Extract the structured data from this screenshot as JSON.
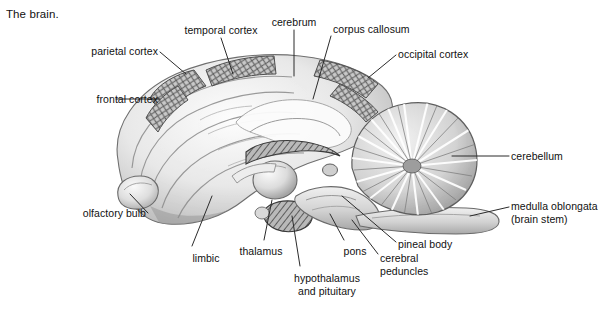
{
  "figure": {
    "title": "The brain.",
    "style": "pencil-shaded anatomical illustration, greyscale",
    "background_color": "#ffffff",
    "ink_color": "#111111",
    "leader_line_color": "#2b2b2b"
  },
  "labels": [
    {
      "id": "frontal-cortex",
      "text": "frontal cortex",
      "align": "right",
      "x": 62,
      "y": 93,
      "w": 96
    },
    {
      "id": "parietal-cortex",
      "text": "parietal cortex",
      "align": "right",
      "x": 30,
      "y": 45,
      "w": 128
    },
    {
      "id": "temporal-cortex",
      "text": "temporal cortex",
      "align": "center",
      "x": 168,
      "y": 24,
      "w": 106
    },
    {
      "id": "cerebrum",
      "text": "cerebrum",
      "align": "center",
      "x": 262,
      "y": 16,
      "w": 64
    },
    {
      "id": "corpus-callosum",
      "text": "corpus callosum",
      "align": "left",
      "x": 333,
      "y": 23,
      "w": 104
    },
    {
      "id": "occipital-cortex",
      "text": "occipital cortex",
      "align": "left",
      "x": 398,
      "y": 48,
      "w": 102
    },
    {
      "id": "cerebellum",
      "text": "cerebellum",
      "align": "left",
      "x": 511,
      "y": 150,
      "w": 78
    },
    {
      "id": "medulla-oblongata",
      "text": "medulla oblongata\n(brain stem)",
      "align": "left",
      "x": 511,
      "y": 200,
      "w": 92
    },
    {
      "id": "olfactory-bulb",
      "text": "olfactory bulb",
      "align": "right",
      "x": 52,
      "y": 207,
      "w": 94
    },
    {
      "id": "limbic",
      "text": "limbic",
      "align": "center",
      "x": 184,
      "y": 252,
      "w": 44
    },
    {
      "id": "thalamus",
      "text": "thalamus",
      "align": "center",
      "x": 232,
      "y": 245,
      "w": 58
    },
    {
      "id": "hypothalamus-pituitary",
      "text": "hypothalamus\nand pituitary",
      "align": "center",
      "x": 282,
      "y": 272,
      "w": 90
    },
    {
      "id": "pons",
      "text": "pons",
      "align": "center",
      "x": 338,
      "y": 245,
      "w": 34
    },
    {
      "id": "pineal-body",
      "text": "pineal body",
      "align": "left",
      "x": 398,
      "y": 238,
      "w": 72
    },
    {
      "id": "cerebral-peduncles",
      "text": "cerebral\npeduncles",
      "align": "left",
      "x": 380,
      "y": 252,
      "w": 74
    }
  ],
  "structures": [
    "frontal cortex",
    "parietal cortex",
    "temporal cortex",
    "occipital cortex",
    "cerebrum",
    "corpus callosum",
    "cerebellum",
    "medulla oblongata (brain stem)",
    "olfactory bulb",
    "limbic",
    "thalamus",
    "hypothalamus and pituitary",
    "pons",
    "pineal body",
    "cerebral peduncles"
  ]
}
